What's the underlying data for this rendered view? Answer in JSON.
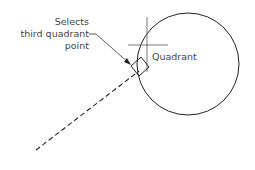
{
  "diagram": {
    "callout_lines": [
      "Selects",
      "third quadrant",
      "point"
    ],
    "quadrant_label": "Quadrant",
    "colors": {
      "stroke": "#222222",
      "text": "#444444",
      "background": "#ffffff"
    },
    "elements": {
      "circle": {
        "cx": 188,
        "cy": 64,
        "r": 51
      },
      "dashed_line": {
        "x1": 36,
        "y1": 150,
        "x2": 138,
        "y2": 72
      },
      "crosshair": {
        "x": 147,
        "y": 45
      },
      "snap_marker": "rotated-square"
    }
  }
}
